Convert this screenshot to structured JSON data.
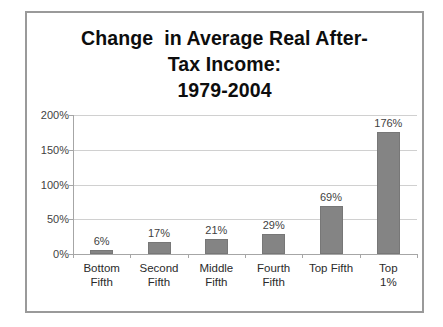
{
  "slide": {
    "background_color": "#ffffff",
    "frame_color": "#9a9a9a"
  },
  "chart_data": {
    "type": "bar",
    "title_lines": [
      "Change  in Average Real After-",
      "Tax Income:",
      "1979-2004"
    ],
    "xlabel": "",
    "ylabel": "",
    "categories": [
      "Bottom\nFifth",
      "Second\nFifth",
      "Middle\nFifth",
      "Fourth\nFifth",
      "Top Fifth",
      "Top 1%"
    ],
    "values": [
      6,
      17,
      21,
      29,
      69,
      176
    ],
    "value_labels": [
      "6%",
      "17%",
      "21%",
      "29%",
      "69%",
      "176%"
    ],
    "ylim": [
      0,
      200
    ],
    "yticks": [
      0,
      50,
      100,
      150,
      200
    ],
    "ytick_labels": [
      "0%",
      "50%",
      "100%",
      "150%",
      "200%"
    ],
    "grid": true,
    "legend": false,
    "bar_color": "#848484",
    "gridline_color": "#d0d0d0",
    "axis_color": "#a6a6a6"
  }
}
